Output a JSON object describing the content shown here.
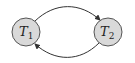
{
  "diagram": {
    "nodes": [
      {
        "id": "T1",
        "label": "T",
        "subscript": "1",
        "cx": 26,
        "cy": 32,
        "r": 14
      },
      {
        "id": "T2",
        "label": "T",
        "subscript": "2",
        "cx": 108,
        "cy": 32,
        "r": 14
      }
    ],
    "edges": [
      {
        "from": "T1",
        "to": "T2",
        "position": "top"
      },
      {
        "from": "T2",
        "to": "T1",
        "position": "bottom"
      }
    ],
    "colors": {
      "node_fill": "#d9d9d9",
      "node_stroke": "#555555",
      "edge": "#333333"
    }
  }
}
